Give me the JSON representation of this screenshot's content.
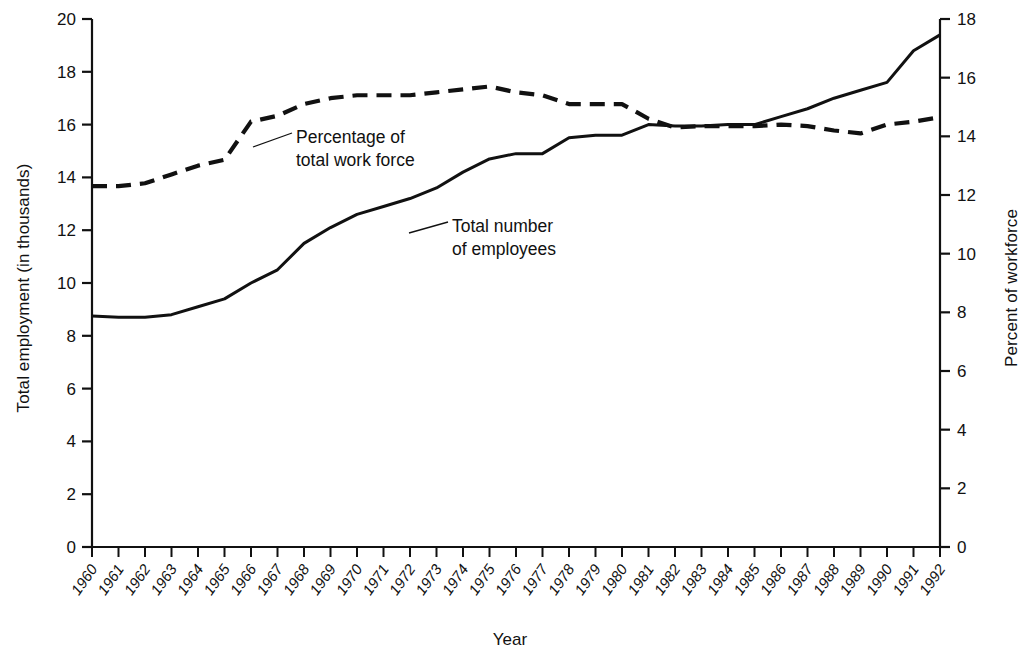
{
  "chart_data": {
    "type": "line",
    "title": "",
    "xlabel": "Year",
    "ylabel_left": "Total employment (in thousands)",
    "ylabel_right": "Percent of workforce",
    "grid": false,
    "legend_position": "inline-annotation",
    "x": [
      1960,
      1961,
      1962,
      1963,
      1964,
      1965,
      1966,
      1967,
      1968,
      1969,
      1970,
      1971,
      1972,
      1973,
      1974,
      1975,
      1976,
      1977,
      1978,
      1979,
      1980,
      1981,
      1982,
      1983,
      1984,
      1985,
      1986,
      1987,
      1988,
      1989,
      1990,
      1991,
      1992
    ],
    "xtick_labels": [
      "1960",
      "1961",
      "1962",
      "1963",
      "1964",
      "1965",
      "1966",
      "1967",
      "1968",
      "1969",
      "1970",
      "1971",
      "1972",
      "1973",
      "1974",
      "1975",
      "1976",
      "1977",
      "1978",
      "1979",
      "1980",
      "1981",
      "1982",
      "1983",
      "1984",
      "1985",
      "1986",
      "1987",
      "1988",
      "1989",
      "1990",
      "1991",
      "1992"
    ],
    "ylim_left": [
      0,
      20
    ],
    "ytick_left": [
      0,
      2,
      4,
      6,
      8,
      10,
      12,
      14,
      16,
      18,
      20
    ],
    "ylim_right": [
      0,
      18
    ],
    "ytick_right": [
      0,
      2,
      4,
      6,
      8,
      10,
      12,
      14,
      16,
      18
    ],
    "series": [
      {
        "name": "Total number of employees",
        "style": "solid",
        "axis": "left",
        "units": "thousands",
        "annotation": "Total number\nof employees",
        "values": [
          8.75,
          8.7,
          8.7,
          8.8,
          9.1,
          9.4,
          10.0,
          10.5,
          11.5,
          12.1,
          12.6,
          12.9,
          13.2,
          13.6,
          14.2,
          14.7,
          14.9,
          14.9,
          15.5,
          15.6,
          15.6,
          16.0,
          15.95,
          15.95,
          16.0,
          16.0,
          16.3,
          16.6,
          17.0,
          17.3,
          17.6,
          18.8,
          19.4
        ]
      },
      {
        "name": "Percentage of total work force",
        "style": "dashed",
        "axis": "right",
        "units": "percent",
        "annotation": "Percentage of\ntotal work force",
        "values": [
          12.3,
          12.3,
          12.4,
          12.7,
          13.0,
          13.2,
          14.5,
          14.7,
          15.1,
          15.3,
          15.4,
          15.4,
          15.4,
          15.5,
          15.6,
          15.7,
          15.5,
          15.4,
          15.1,
          15.1,
          15.1,
          14.6,
          14.3,
          14.35,
          14.35,
          14.35,
          14.4,
          14.35,
          14.2,
          14.1,
          14.4,
          14.5,
          14.65
        ]
      }
    ]
  }
}
